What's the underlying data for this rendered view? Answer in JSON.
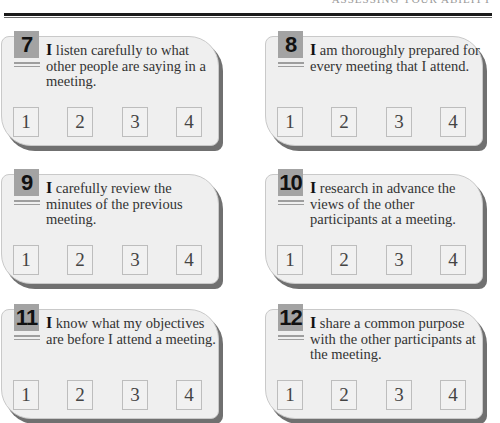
{
  "header": {
    "title": "ASSESSING YOUR ABILITY"
  },
  "rating_scale": [
    "1",
    "2",
    "3",
    "4"
  ],
  "questions": [
    {
      "number": "7",
      "first_word": "I",
      "text": " listen carefully to what other people are saying in a meeting."
    },
    {
      "number": "8",
      "first_word": "I",
      "text": " am thoroughly prepared for every meeting that I attend."
    },
    {
      "number": "9",
      "first_word": "I",
      "text": " carefully review the minutes of the previous meeting."
    },
    {
      "number": "10",
      "first_word": "I",
      "text": " research in advance the views of the other participants at a meeting."
    },
    {
      "number": "11",
      "first_word": "I",
      "text": " know what my objectives are before I attend a meeting."
    },
    {
      "number": "12",
      "first_word": "I",
      "text": " share a common purpose with the other participants at the meeting."
    }
  ]
}
